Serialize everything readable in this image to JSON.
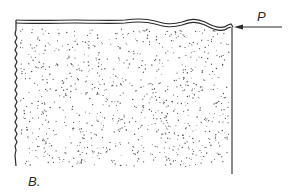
{
  "figure": {
    "panel_label": "B.",
    "force_label": "P"
  },
  "colors": {
    "ink": "#2a2a2a",
    "stipple": "#555555",
    "background": "#ffffff"
  }
}
